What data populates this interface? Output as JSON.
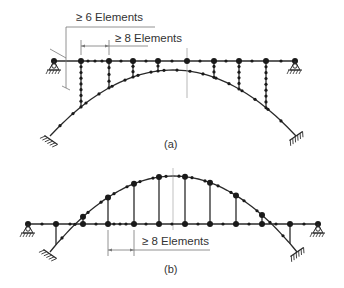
{
  "diagram": {
    "colors": {
      "line": "#2a2a2a",
      "dim": "#777777",
      "node": "#1a1a1a",
      "background": "#ffffff"
    },
    "panel_a": {
      "caption": "(a)",
      "dim_label_outer": "≥ 6 Elements",
      "dim_label_inner": "≥ 8 Elements"
    },
    "panel_b": {
      "caption": "(b)",
      "dim_label": "≥ 8 Elements"
    },
    "legend_icons": [
      "pin-support-icon",
      "fixed-support-icon",
      "node-icon"
    ]
  }
}
